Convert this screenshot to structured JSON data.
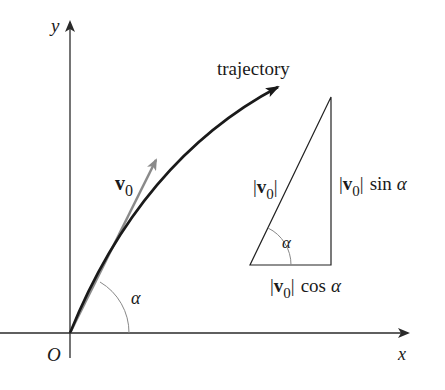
{
  "diagram": {
    "type": "projectile-motion",
    "axes": {
      "x_label": "x",
      "y_label": "y",
      "origin_label": "O"
    },
    "trajectory_label": "trajectory",
    "velocity_vector": {
      "symbol": "v",
      "subscript": "0"
    },
    "launch_angle_label": "α",
    "triangle": {
      "hypotenuse": {
        "open": "|",
        "symbol": "v",
        "subscript": "0",
        "close": "|"
      },
      "vertical_side": {
        "open": "|",
        "symbol": "v",
        "subscript": "0",
        "close": "|",
        "func": "sin",
        "angle": "α"
      },
      "horizontal_side": {
        "open": "|",
        "symbol": "v",
        "subscript": "0",
        "close": "|",
        "func": "cos",
        "angle": "α"
      },
      "angle_label": "α"
    },
    "colors": {
      "axes": "#2a2a2a",
      "trajectory": "#1a1a1a",
      "velocity_vector": "#8a8a8a",
      "arc": "#888888",
      "triangle": "#222222"
    }
  }
}
